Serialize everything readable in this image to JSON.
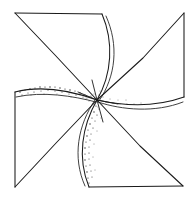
{
  "drawing": {
    "title": "Pinwheel",
    "subject": "pinwheel",
    "medium": "line drawing",
    "style": "black ink outline with stippled shading",
    "background_color": "#ffffff",
    "ink_color": "#1a1a1a",
    "stipple_color": "#2a2a2a",
    "canvas": {
      "width": 190,
      "height": 197
    },
    "blade_count": 4,
    "rotation_sense": "clockwise",
    "center_point": {
      "x": 97,
      "y": 100,
      "label": "hub"
    },
    "outer_corners": [
      {
        "name": "top-left",
        "x": 15,
        "y": 13
      },
      {
        "name": "top-right",
        "x": 184,
        "y": 13
      },
      {
        "name": "bottom-right",
        "x": 183,
        "y": 186
      },
      {
        "name": "bottom-left",
        "x": 15,
        "y": 187
      }
    ],
    "edge_junctions": [
      {
        "name": "top-edge-junction",
        "x": 102,
        "y": 14
      },
      {
        "name": "right-edge-junction",
        "x": 184,
        "y": 97
      },
      {
        "name": "bottom-edge-junction",
        "x": 89,
        "y": 187
      },
      {
        "name": "left-edge-junction",
        "x": 15,
        "y": 92
      }
    ],
    "notch_vertices": [
      {
        "name": "upper-left-notch",
        "x": 55,
        "y": 55
      },
      {
        "name": "upper-right-notch",
        "x": 143,
        "y": 58
      },
      {
        "name": "lower-right-notch",
        "x": 140,
        "y": 146
      },
      {
        "name": "lower-left-notch",
        "x": 57,
        "y": 142
      }
    ],
    "blades": [
      {
        "name": "top-blade",
        "id": "blade-top",
        "shaded": false,
        "tip_corner": "top-left",
        "path": "M 97 100 L 15 13 L 102 14 C 110 40 108 70 97 100 Z"
      },
      {
        "name": "right-blade",
        "id": "blade-right",
        "shaded": false,
        "tip_corner": "top-right",
        "path": "M 97 100 L 184 13 L 184 97 C 158 104 126 104 97 100 Z"
      },
      {
        "name": "bottom-blade",
        "id": "blade-bottom",
        "shaded": true,
        "tip_corner": "bottom-right",
        "path": "M 97 100 L 183 186 L 89 187 C 80 158 84 128 97 100 Z"
      },
      {
        "name": "left-blade",
        "id": "blade-left",
        "shaded": true,
        "tip_corner": "bottom-left",
        "path": "M 97 100 L 15 187 L 15 92 C 40 87 70 92 97 100 Z"
      }
    ],
    "shaded_regions": [
      {
        "name": "left-blade-stipple",
        "along": "upper curved edge of left blade",
        "density": "medium"
      },
      {
        "name": "bottom-blade-stipple",
        "along": "left curved edge of bottom blade",
        "density": "medium"
      },
      {
        "name": "hub-stipple",
        "along": "around center hub",
        "density": "light"
      },
      {
        "name": "right-blade-stipple",
        "along": "inner lower edge of right blade",
        "density": "light"
      }
    ]
  }
}
